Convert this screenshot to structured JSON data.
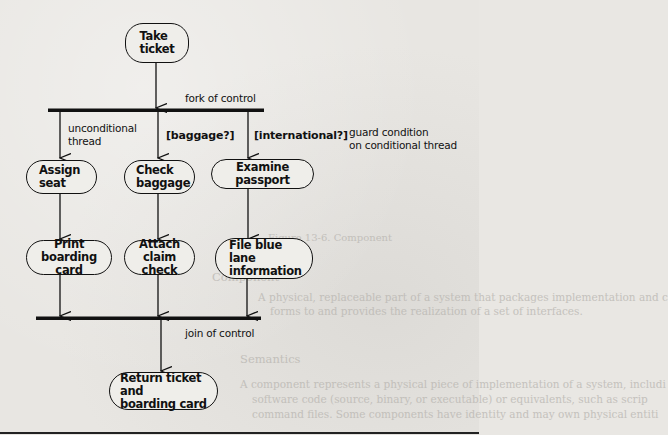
{
  "diagram": {
    "type": "UML activity diagram (fork/join)",
    "nodes": {
      "take_ticket": "Take\nticket",
      "assign_seat": "Assign\nseat",
      "check_baggage": "Check\nbaggage",
      "examine_passport": "Examine passport",
      "print_boarding_card": "Print\nboarding card",
      "attach_claim_check": "Attach\nclaim check",
      "file_blue_lane": "File blue lane\ninformation",
      "return_ticket": "Return ticket and\nboarding card"
    },
    "annotations": {
      "fork": "fork of control",
      "join": "join of control",
      "unconditional": "unconditional\nthread",
      "guard_note": "guard condition\non conditional thread"
    },
    "guards": {
      "baggage": "[baggage?]",
      "international": "[international?]"
    },
    "edges": [
      {
        "from": "take_ticket",
        "to": "fork"
      },
      {
        "from": "fork",
        "to": "assign_seat"
      },
      {
        "from": "fork",
        "to": "check_baggage",
        "guard": "[baggage?]"
      },
      {
        "from": "fork",
        "to": "examine_passport",
        "guard": "[international?]"
      },
      {
        "from": "assign_seat",
        "to": "print_boarding_card"
      },
      {
        "from": "check_baggage",
        "to": "attach_claim_check"
      },
      {
        "from": "examine_passport",
        "to": "file_blue_lane"
      },
      {
        "from": "print_boarding_card",
        "to": "join"
      },
      {
        "from": "attach_claim_check",
        "to": "join"
      },
      {
        "from": "file_blue_lane",
        "to": "join"
      },
      {
        "from": "join",
        "to": "return_ticket"
      }
    ]
  },
  "background_bleed": {
    "caption": "Figure 13-6. Component",
    "heading1": "Component",
    "heading2": "Semantics",
    "line1": "A physical, replaceable part of a system that packages implementation and c",
    "line2": "forms to and provides the realization of a set of interfaces.",
    "line3": "A component represents a physical piece of implementation of a system, includi",
    "line4": "software code (source, binary, or executable) or equivalents, such as scrip",
    "line5": "command files. Some components have identity and may own physical entiti"
  }
}
